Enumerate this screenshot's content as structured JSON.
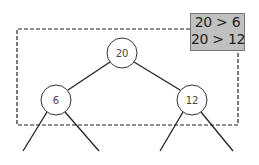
{
  "diagram": {
    "type": "binary-tree",
    "nodes": [
      {
        "id": "root",
        "label": "20",
        "cx": 122,
        "cy": 53
      },
      {
        "id": "left",
        "label": "6",
        "cx": 56,
        "cy": 100
      },
      {
        "id": "right",
        "label": "12",
        "cx": 192,
        "cy": 100
      }
    ],
    "comparisons": {
      "line1": "20 > 6",
      "line2": "20 > 12"
    },
    "colors": {
      "comparison_bg": "#c0c0c0",
      "stroke": "#222222"
    }
  }
}
